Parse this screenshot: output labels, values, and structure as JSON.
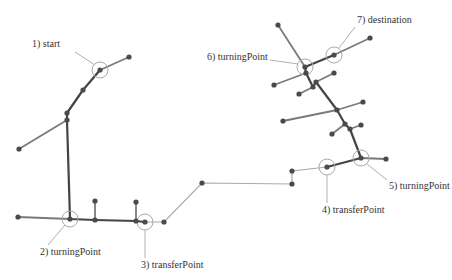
{
  "diagram": {
    "colors": {
      "main_route": "#444444",
      "branch": "#777777",
      "connector": "#aaaaaa",
      "node": "#444444",
      "highlight_circle": "#aaaaaa",
      "leader_line": "#b0b0b0",
      "label_text": "#333333"
    },
    "labels": [
      {
        "id": "start",
        "text": "1) start",
        "x": 32,
        "y": 47,
        "anchor_x": 100,
        "anchor_y": 70
      },
      {
        "id": "turningPoint-2",
        "text": "2) turningPoint",
        "x": 40,
        "y": 255,
        "anchor_x": 70,
        "anchor_y": 219
      },
      {
        "id": "transferPoint-3",
        "text": "3) transferPoint",
        "x": 141,
        "y": 268,
        "anchor_x": 145,
        "anchor_y": 222
      },
      {
        "id": "transferPoint-4",
        "text": "4) transferPoint",
        "x": 322,
        "y": 213,
        "anchor_x": 327,
        "anchor_y": 167
      },
      {
        "id": "turningPoint-5",
        "text": "5) turningPoint",
        "x": 389,
        "y": 189,
        "anchor_x": 361,
        "anchor_y": 158
      },
      {
        "id": "turningPoint-6",
        "text": "6) turningPoint",
        "x": 207,
        "y": 60,
        "anchor_x": 305,
        "anchor_y": 67
      },
      {
        "id": "destination",
        "text": "7) destination",
        "x": 357,
        "y": 23,
        "anchor_x": 334,
        "anchor_y": 55
      }
    ]
  }
}
